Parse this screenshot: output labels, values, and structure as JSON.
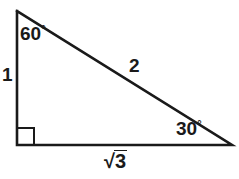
{
  "figure": {
    "background_color": "#ffffff",
    "stroke_color": "#1a1a1a",
    "stroke_width": 2.6
  },
  "geometry": {
    "apex": {
      "x": 17,
      "y": 11
    },
    "right_angle_vertex": {
      "x": 17,
      "y": 145
    },
    "right_vertex": {
      "x": 232,
      "y": 145
    },
    "right_angle_marker_size": 17
  },
  "labels": {
    "angle_apex": {
      "value": "60",
      "degree_symbol": "°"
    },
    "angle_right": {
      "value": "30",
      "degree_symbol": "°"
    },
    "side_vertical": "1",
    "side_hypotenuse": "2",
    "side_base": {
      "radical": "√",
      "radicand": "3",
      "text": "√3"
    }
  }
}
